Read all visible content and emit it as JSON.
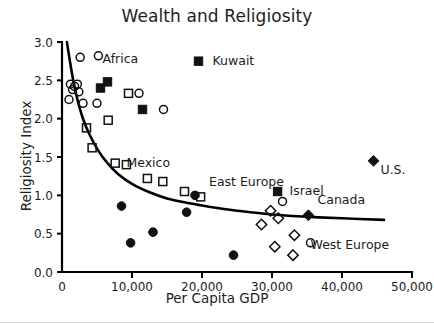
{
  "chart_data": {
    "type": "scatter",
    "title": "Wealth and Religiosity",
    "xlabel": "Per Capita GDP",
    "ylabel": "Religiosity Index",
    "xlim": [
      0,
      50000
    ],
    "ylim": [
      0.0,
      3.0
    ],
    "grid": false,
    "legend": "none",
    "xticks": [
      0,
      10000,
      20000,
      30000,
      40000,
      50000
    ],
    "xticklabels": [
      "0",
      "10,000",
      "20,000",
      "30,000",
      "40,000",
      "50,000"
    ],
    "yticks": [
      0.0,
      0.5,
      1.0,
      1.5,
      2.0,
      2.5,
      3.0
    ],
    "yticklabels": [
      "0.0",
      "0.5",
      "1.0",
      "1.5",
      "2.0",
      "2.5",
      "3.0"
    ],
    "series": [
      {
        "name": "open-circle",
        "marker": "open-circle",
        "points": [
          [
            1200,
            2.45
          ],
          [
            1500,
            2.38
          ],
          [
            1800,
            2.42
          ],
          [
            1000,
            2.25
          ],
          [
            2600,
            2.8
          ],
          [
            2200,
            2.45
          ],
          [
            2400,
            2.35
          ],
          [
            3000,
            2.2
          ],
          [
            5200,
            2.82
          ],
          [
            5000,
            2.2
          ],
          [
            11000,
            2.33
          ],
          [
            14500,
            2.12
          ],
          [
            31500,
            0.92
          ],
          [
            35500,
            0.38
          ]
        ]
      },
      {
        "name": "filled-square",
        "marker": "filled-square",
        "points": [
          [
            5500,
            2.4
          ],
          [
            6500,
            2.48
          ],
          [
            11500,
            2.12
          ],
          [
            19500,
            2.75
          ],
          [
            30800,
            1.05
          ]
        ]
      },
      {
        "name": "open-square",
        "marker": "open-square",
        "points": [
          [
            3500,
            1.88
          ],
          [
            4300,
            1.62
          ],
          [
            6600,
            1.98
          ],
          [
            9500,
            2.33
          ],
          [
            7600,
            1.42
          ],
          [
            9200,
            1.4
          ],
          [
            12200,
            1.22
          ],
          [
            14400,
            1.18
          ],
          [
            17500,
            1.05
          ],
          [
            19800,
            0.98
          ]
        ]
      },
      {
        "name": "filled-circle",
        "marker": "filled-circle",
        "points": [
          [
            8500,
            0.86
          ],
          [
            9800,
            0.38
          ],
          [
            13000,
            0.52
          ],
          [
            17800,
            0.78
          ],
          [
            19000,
            1.0
          ],
          [
            24500,
            0.22
          ]
        ]
      },
      {
        "name": "open-diamond",
        "marker": "open-diamond",
        "points": [
          [
            28500,
            0.62
          ],
          [
            29800,
            0.8
          ],
          [
            30900,
            0.7
          ],
          [
            30400,
            0.33
          ],
          [
            33200,
            0.48
          ],
          [
            33000,
            0.22
          ]
        ]
      },
      {
        "name": "filled-diamond",
        "marker": "filled-diamond",
        "points": [
          [
            35200,
            0.74
          ],
          [
            44500,
            1.45
          ]
        ]
      }
    ],
    "fit_curve": {
      "description": "decaying trend line",
      "points": [
        [
          700,
          3.0
        ],
        [
          1500,
          2.55
        ],
        [
          2200,
          2.25
        ],
        [
          3000,
          2.0
        ],
        [
          4000,
          1.78
        ],
        [
          5200,
          1.58
        ],
        [
          6500,
          1.42
        ],
        [
          8000,
          1.28
        ],
        [
          10000,
          1.15
        ],
        [
          12500,
          1.04
        ],
        [
          15000,
          0.96
        ],
        [
          18000,
          0.9
        ],
        [
          21000,
          0.85
        ],
        [
          25000,
          0.8
        ],
        [
          30000,
          0.75
        ],
        [
          35000,
          0.72
        ],
        [
          40000,
          0.7
        ],
        [
          46000,
          0.68
        ]
      ]
    },
    "annotations": [
      {
        "text": "Africa",
        "x": 5800,
        "y": 2.78,
        "marker": null
      },
      {
        "text": "Kuwait",
        "x": 21500,
        "y": 2.75,
        "marker": null
      },
      {
        "text": "Mexico",
        "x": 9200,
        "y": 1.42,
        "marker": null
      },
      {
        "text": "East Europe",
        "x": 21000,
        "y": 1.18,
        "marker": null
      },
      {
        "text": "Israel",
        "x": 32500,
        "y": 1.06,
        "marker": null
      },
      {
        "text": "Canada",
        "x": 36500,
        "y": 0.94,
        "marker": null
      },
      {
        "text": "U.S.",
        "x": 45500,
        "y": 1.33,
        "marker": null
      },
      {
        "text": "West Europe",
        "x": 35500,
        "y": 0.35,
        "marker": null
      }
    ]
  }
}
